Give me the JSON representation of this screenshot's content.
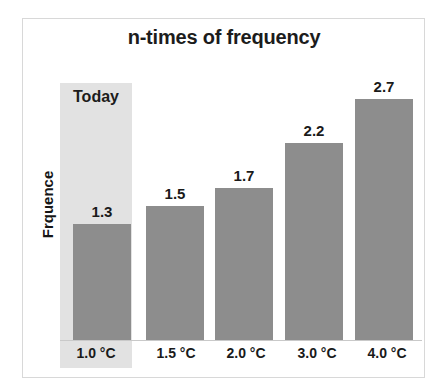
{
  "figure": {
    "frame_border_color": "#d8d8d8",
    "background_color": "#ffffff"
  },
  "chart_data": {
    "type": "bar",
    "title": "n-times of frequency",
    "xlabel": "",
    "ylabel": "Frquence",
    "categories": [
      "1.0 °C",
      "1.5 °C",
      "2.0 °C",
      "3.0 °C",
      "4.0 °C"
    ],
    "values": [
      1.3,
      1.5,
      1.7,
      2.2,
      2.7
    ],
    "value_labels": [
      "1.3",
      "1.5",
      "1.7",
      "2.2",
      "2.7"
    ],
    "ylim": [
      0,
      3.0
    ],
    "grid": false,
    "legend": null,
    "bar_color": "#8d8d8d",
    "annotations": [
      {
        "text": "Today",
        "type": "highlight-band",
        "category": "1.0 °C",
        "band_color": "#e2e2e2"
      }
    ]
  }
}
